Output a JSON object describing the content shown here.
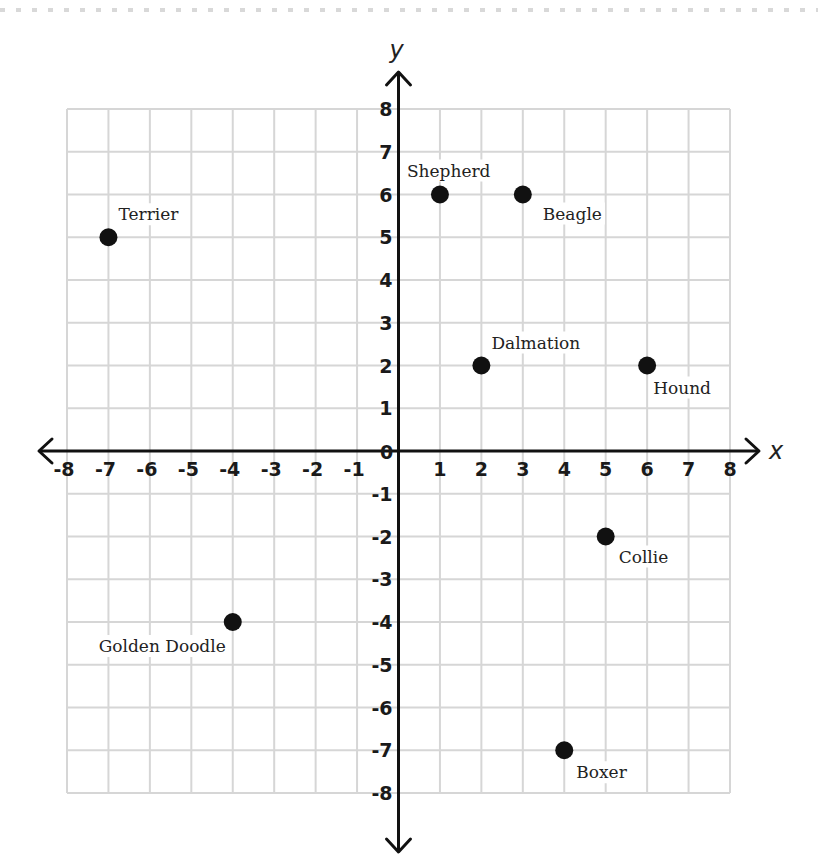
{
  "chart_data": {
    "type": "scatter",
    "title": "",
    "xlabel": "x",
    "ylabel": "y",
    "xlim": [
      -8,
      8
    ],
    "ylim": [
      -8,
      8
    ],
    "grid": true,
    "x_ticks": [
      "-8",
      "-7",
      "-6",
      "-5",
      "-4",
      "-3",
      "-2",
      "-1",
      "0",
      "1",
      "2",
      "3",
      "4",
      "5",
      "6",
      "7",
      "8"
    ],
    "y_ticks": [
      "8",
      "7",
      "6",
      "5",
      "4",
      "3",
      "2",
      "1",
      "-1",
      "-2",
      "-3",
      "-4",
      "-5",
      "-6",
      "-7",
      "-8"
    ],
    "points": [
      {
        "name": "Terrier",
        "x": -7,
        "y": 5
      },
      {
        "name": "Shepherd",
        "x": 1,
        "y": 6
      },
      {
        "name": "Beagle",
        "x": 3,
        "y": 6
      },
      {
        "name": "Dalmation",
        "x": 2,
        "y": 2
      },
      {
        "name": "Hound",
        "x": 6,
        "y": 2
      },
      {
        "name": "Collie",
        "x": 5,
        "y": -2
      },
      {
        "name": "Golden Doodle",
        "x": -4,
        "y": -4
      },
      {
        "name": "Boxer",
        "x": 4,
        "y": -7
      }
    ],
    "colors": {
      "grid": "#d6d6d6",
      "axis": "#111111",
      "point": "#111111"
    }
  }
}
